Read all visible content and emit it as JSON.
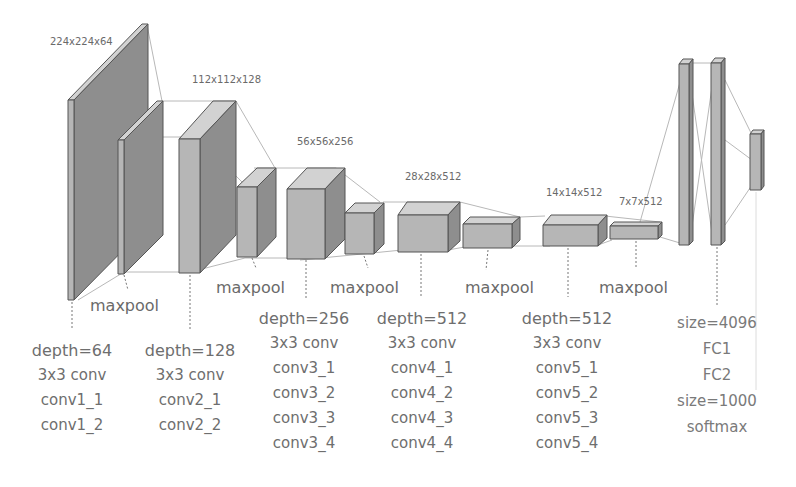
{
  "colors": {
    "front_face": "#b5b5b5",
    "side_face": "#8c8c8c",
    "top_face": "#d0d0d0",
    "edge": "#555555",
    "connector": "#b0b0b0",
    "text": "#6e6e6e"
  },
  "dimensions": {
    "d1": "224x224x64",
    "d2": "112x112x128",
    "d3": "56x56x256",
    "d4": "28x28x512",
    "d5": "14x14x512",
    "d6": "7x7x512"
  },
  "pool_label": "maxpool",
  "blocks": [
    {
      "depth": "depth=64",
      "kernel": "3x3 conv",
      "layers": [
        "conv1_1",
        "conv1_2"
      ]
    },
    {
      "depth": "depth=128",
      "kernel": "3x3 conv",
      "layers": [
        "conv2_1",
        "conv2_2"
      ]
    },
    {
      "depth": "depth=256",
      "kernel": "3x3 conv",
      "layers": [
        "conv3_1",
        "conv3_2",
        "conv3_3",
        "conv3_4"
      ]
    },
    {
      "depth": "depth=512",
      "kernel": "3x3 conv",
      "layers": [
        "conv4_1",
        "conv4_2",
        "conv4_3",
        "conv4_4"
      ]
    },
    {
      "depth": "depth=512",
      "kernel": "3x3 conv",
      "layers": [
        "conv5_1",
        "conv5_2",
        "conv5_3",
        "conv5_4"
      ]
    }
  ],
  "fc": {
    "size1": "size=4096",
    "fc1": "FC1",
    "fc2": "FC2",
    "size2": "size=1000",
    "softmax": "softmax"
  }
}
